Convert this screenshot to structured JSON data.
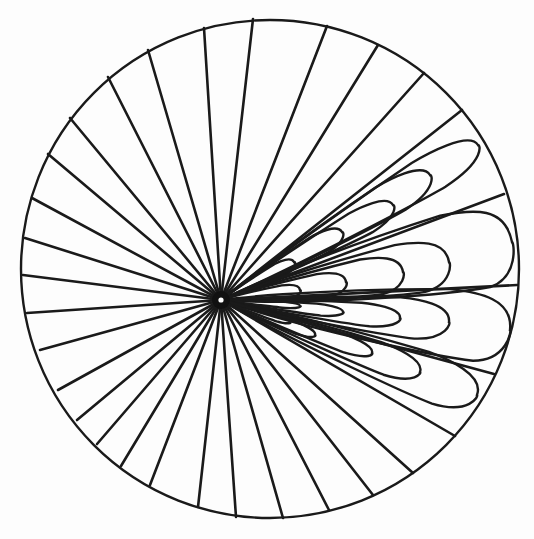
{
  "figure": {
    "type": "ray-diagram",
    "colors": {
      "stroke": "#1a1a1a",
      "background": "#fdfdfd"
    },
    "circle": {
      "cx": 270,
      "cy": 269,
      "r": 249
    },
    "focus": {
      "x": 221,
      "y": 300
    },
    "ray_endpoints": [
      [
        253,
        19
      ],
      [
        327,
        26
      ],
      [
        378,
        45
      ],
      [
        424,
        73
      ],
      [
        462,
        110
      ],
      [
        504,
        194
      ],
      [
        517,
        285
      ],
      [
        494,
        374
      ],
      [
        455,
        436
      ],
      [
        413,
        473
      ],
      [
        373,
        495
      ],
      [
        329,
        510
      ],
      [
        283,
        518
      ],
      [
        236,
        517
      ],
      [
        198,
        507
      ],
      [
        150,
        485
      ],
      [
        121,
        466
      ],
      [
        97,
        444
      ],
      [
        77,
        420
      ],
      [
        58,
        390
      ],
      [
        40,
        350
      ],
      [
        27,
        313
      ],
      [
        23,
        275
      ],
      [
        25,
        238
      ],
      [
        32,
        198
      ],
      [
        48,
        154
      ],
      [
        70,
        118
      ],
      [
        108,
        77
      ],
      [
        148,
        50
      ],
      [
        204,
        28
      ]
    ],
    "loops": [
      {
        "tip": [
          478,
          145
        ],
        "a1": -38,
        "a2": -30,
        "len": 300
      },
      {
        "tip": [
          430,
          175
        ],
        "a1": -32,
        "a2": -23,
        "len": 235
      },
      {
        "tip": [
          393,
          205
        ],
        "a1": -26,
        "a2": -17,
        "len": 185
      },
      {
        "tip": [
          342,
          232
        ],
        "a1": -22,
        "a2": -12,
        "len": 130
      },
      {
        "tip": [
          294,
          262
        ],
        "a1": -18,
        "a2": -7,
        "len": 78
      },
      {
        "tip": [
          512,
          242
        ],
        "a1": -23,
        "a2": -6,
        "len": 295
      },
      {
        "tip": [
          449,
          262
        ],
        "a1": -17,
        "a2": -3,
        "len": 230
      },
      {
        "tip": [
          403,
          272
        ],
        "a1": -13,
        "a2": 0,
        "len": 185
      },
      {
        "tip": [
          346,
          282
        ],
        "a1": -10,
        "a2": 2,
        "len": 125
      },
      {
        "tip": [
          300,
          290
        ],
        "a1": -7,
        "a2": 4,
        "len": 80
      },
      {
        "tip": [
          510,
          330
        ],
        "a1": 2,
        "a2": 17,
        "len": 290
      },
      {
        "tip": [
          449,
          322
        ],
        "a1": 3,
        "a2": 14,
        "len": 230
      },
      {
        "tip": [
          400,
          318
        ],
        "a1": 4,
        "a2": 12,
        "len": 180
      },
      {
        "tip": [
          343,
          312
        ],
        "a1": 4,
        "a2": 10,
        "len": 122
      },
      {
        "tip": [
          300,
          306
        ],
        "a1": 3,
        "a2": 8,
        "len": 80
      },
      {
        "tip": [
          477,
          395
        ],
        "a1": 19,
        "a2": 30,
        "len": 270
      },
      {
        "tip": [
          420,
          372
        ],
        "a1": 15,
        "a2": 24,
        "len": 210
      },
      {
        "tip": [
          372,
          353
        ],
        "a1": 13,
        "a2": 20,
        "len": 160
      },
      {
        "tip": [
          315,
          335
        ],
        "a1": 10,
        "a2": 17,
        "len": 100
      },
      {
        "tip": [
          290,
          322
        ],
        "a1": 8,
        "a2": 14,
        "len": 72
      }
    ]
  }
}
